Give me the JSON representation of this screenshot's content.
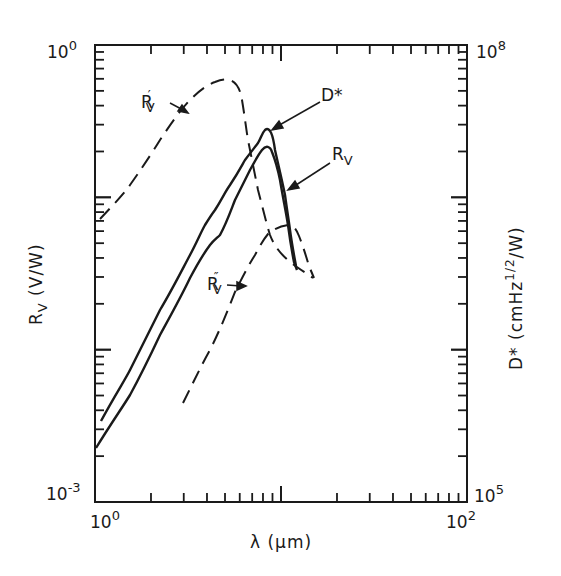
{
  "chart_data": {
    "type": "line",
    "title": "",
    "xlabel": "λ (μm)",
    "ylabel": "R_V (V/W)",
    "ylabel_right": "D* (cmHz^1/2/W)",
    "xscale": "log",
    "yscale": "log",
    "xlim": [
      1,
      100
    ],
    "ylim": [
      0.001,
      1
    ],
    "ylim_right": [
      100000,
      100000000
    ],
    "grid": false,
    "legend": "inline labels with arrows",
    "tick_labels": {
      "x": [
        {
          "base": "10",
          "exp": "0"
        },
        {
          "base": "10",
          "exp": "2"
        }
      ],
      "y_left": [
        {
          "base": "10",
          "exp": "-3"
        },
        {
          "base": "10",
          "exp": "0"
        }
      ],
      "y_right": [
        {
          "base": "10",
          "exp": "5"
        },
        {
          "base": "10",
          "exp": "8"
        }
      ]
    },
    "series": [
      {
        "name": "D*",
        "style": "solid",
        "axis": "right",
        "x": [
          1.03,
          1.43,
          2.06,
          2.95,
          3.54,
          3.99,
          4.78,
          5.72,
          6.7,
          7.39,
          7.99,
          8.52,
          9.08,
          9.57,
          10.2,
          10.65
        ],
        "values": [
          300000.0,
          600000.0,
          1500000.0,
          3500000.0,
          5600000.0,
          7000000.0,
          10300000.0,
          15000000.0,
          20000000.0,
          25500000.0,
          28000000.0,
          22000000.0,
          11000000.0,
          6500000.0,
          3900000.0,
          2600000.0
        ]
      },
      {
        "name": "R_V",
        "style": "solid",
        "axis": "left",
        "x": [
          1.0,
          1.43,
          2.06,
          2.95,
          3.83,
          4.27,
          5.0,
          6.11,
          7.22,
          8.52,
          9.71,
          10.52,
          11.14,
          11.45
        ],
        "values": [
          0.0014,
          0.003,
          0.0076,
          0.018,
          0.031,
          0.036,
          0.062,
          0.098,
          0.15,
          0.21,
          0.15,
          0.07,
          0.045,
          0.033
        ]
      },
      {
        "name": "R'_V",
        "style": "dashed",
        "axis": "left",
        "x": [
          1.03,
          1.43,
          2.06,
          2.95,
          4.0,
          4.92,
          5.5,
          5.9,
          6.14,
          6.9,
          7.9,
          9.0,
          10.4,
          13.2
        ],
        "values": [
          0.072,
          0.12,
          0.24,
          0.44,
          0.57,
          0.59,
          0.59,
          0.47,
          0.27,
          0.13,
          0.072,
          0.046,
          0.028,
          0.023
        ]
      },
      {
        "name": "R''_V",
        "style": "dashed",
        "axis": "left",
        "x": [
          2.59,
          3.54,
          4.78,
          6.11,
          7.22,
          8.52,
          10.0,
          11.2,
          12.3,
          13.5
        ],
        "values": [
          0.0045,
          0.01,
          0.025,
          0.042,
          0.057,
          0.063,
          0.066,
          0.06,
          0.047,
          0.03
        ]
      }
    ],
    "annotations": [
      {
        "text": "R'_V",
        "points_to": "R'_V rising branch near λ≈2.5 µm"
      },
      {
        "text": "D*",
        "points_to": "D* peak near λ≈8 µm"
      },
      {
        "text": "R_V",
        "points_to": "R_V falling branch near λ≈10 µm"
      },
      {
        "text": "R''_V",
        "points_to": "R''_V rising branch near λ≈4.5 µm"
      }
    ]
  },
  "labels": {
    "x_axis": "λ (μm)",
    "y_left_main": "R",
    "y_left_sub": "V",
    "y_left_rest": " (V/W)",
    "y_right_main": "D* (cmHz",
    "y_right_sup": "1/2",
    "y_right_rest": "/W)",
    "tick_x_min_base": "10",
    "tick_x_min_exp": "0",
    "tick_x_max_base": "10",
    "tick_x_max_exp": "2",
    "tick_yl_min_base": "10",
    "tick_yl_min_exp": "-3",
    "tick_yl_max_base": "10",
    "tick_yl_max_exp": "0",
    "tick_yr_min_base": "10",
    "tick_yr_min_exp": "5",
    "tick_yr_max_base": "10",
    "tick_yr_max_exp": "8",
    "curve_rv_prime_main": "R",
    "curve_rv_prime_sub": "V",
    "curve_rv_prime_mark": "′",
    "curve_dstar": "D*",
    "curve_rv_main": "R",
    "curve_rv_sub": "V",
    "curve_rv_dprime_main": "R",
    "curve_rv_dprime_sub": "V",
    "curve_rv_dprime_mark": "″"
  }
}
